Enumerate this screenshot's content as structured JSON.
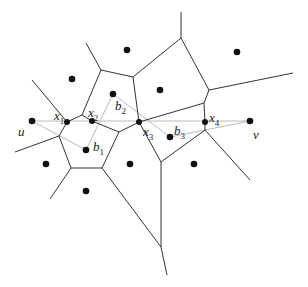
{
  "diagram": {
    "type": "voronoi-path",
    "colors": {
      "edge": "#333333",
      "path": "#bbbbbb",
      "site": "#111111"
    },
    "sites": [
      [
        127,
        50
      ],
      [
        237,
        52
      ],
      [
        72,
        79
      ],
      [
        160,
        90
      ],
      [
        113,
        94
      ],
      [
        32,
        121
      ],
      [
        250,
        121
      ],
      [
        86,
        150
      ],
      [
        170,
        137
      ],
      [
        46,
        164
      ],
      [
        130,
        164
      ],
      [
        194,
        164
      ],
      [
        86,
        191
      ]
    ],
    "path_points": [
      [
        67,
        122
      ],
      [
        92,
        121
      ],
      [
        139,
        122
      ],
      [
        205,
        122
      ]
    ],
    "edges": [
      [
        [
          86,
          43
        ],
        [
          101,
          70
        ]
      ],
      [
        [
          101,
          70
        ],
        [
          133,
          77
        ]
      ],
      [
        [
          101,
          70
        ],
        [
          82,
          115
        ]
      ],
      [
        [
          133,
          77
        ],
        [
          181,
          38
        ]
      ],
      [
        [
          181,
          38
        ],
        [
          181,
          12
        ]
      ],
      [
        [
          181,
          38
        ],
        [
          209,
          90
        ]
      ],
      [
        [
          209,
          90
        ],
        [
          293,
          73
        ]
      ],
      [
        [
          209,
          90
        ],
        [
          204,
          103
        ]
      ],
      [
        [
          204,
          103
        ],
        [
          139,
          122
        ]
      ],
      [
        [
          133,
          77
        ],
        [
          139,
          122
        ]
      ],
      [
        [
          204,
          103
        ],
        [
          205,
          122
        ]
      ],
      [
        [
          82,
          115
        ],
        [
          67,
          122
        ]
      ],
      [
        [
          82,
          115
        ],
        [
          92,
          121
        ]
      ],
      [
        [
          32,
          80
        ],
        [
          67,
          122
        ]
      ],
      [
        [
          67,
          122
        ],
        [
          59,
          136
        ]
      ],
      [
        [
          59,
          136
        ],
        [
          15,
          152
        ]
      ],
      [
        [
          59,
          136
        ],
        [
          71,
          168
        ]
      ],
      [
        [
          71,
          168
        ],
        [
          102,
          168
        ]
      ],
      [
        [
          102,
          168
        ],
        [
          119,
          132
        ]
      ],
      [
        [
          119,
          132
        ],
        [
          92,
          121
        ]
      ],
      [
        [
          119,
          132
        ],
        [
          139,
          122
        ]
      ],
      [
        [
          139,
          122
        ],
        [
          161,
          162
        ]
      ],
      [
        [
          161,
          162
        ],
        [
          205,
          130
        ]
      ],
      [
        [
          205,
          130
        ],
        [
          205,
          122
        ]
      ],
      [
        [
          205,
          130
        ],
        [
          250,
          180
        ]
      ],
      [
        [
          161,
          162
        ],
        [
          161,
          247
        ]
      ],
      [
        [
          102,
          168
        ],
        [
          161,
          247
        ]
      ],
      [
        [
          161,
          247
        ],
        [
          167,
          275
        ]
      ],
      [
        [
          71,
          168
        ],
        [
          50,
          199
        ]
      ]
    ],
    "path_lines": [
      [
        [
          32,
          121
        ],
        [
          250,
          121
        ]
      ],
      [
        [
          32,
          121
        ],
        [
          86,
          150
        ]
      ],
      [
        [
          86,
          150
        ],
        [
          113,
          94
        ]
      ],
      [
        [
          113,
          94
        ],
        [
          170,
          137
        ]
      ],
      [
        [
          170,
          137
        ],
        [
          250,
          121
        ]
      ]
    ],
    "labels": [
      {
        "base": "u",
        "sub": "",
        "x": 18,
        "y": 125
      },
      {
        "base": "x",
        "sub": "1",
        "x": 54,
        "y": 109
      },
      {
        "base": "x",
        "sub": "2",
        "x": 88,
        "y": 106
      },
      {
        "base": "b",
        "sub": "2",
        "x": 115,
        "y": 99
      },
      {
        "base": "x",
        "sub": "3",
        "x": 143,
        "y": 125
      },
      {
        "base": "b",
        "sub": "3",
        "x": 174,
        "y": 124
      },
      {
        "base": "b",
        "sub": "1",
        "x": 93,
        "y": 140
      },
      {
        "base": "x",
        "sub": "4",
        "x": 209,
        "y": 111
      },
      {
        "base": "v",
        "sub": "",
        "x": 253,
        "y": 128
      }
    ]
  }
}
